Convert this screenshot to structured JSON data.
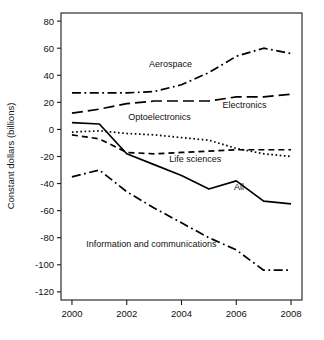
{
  "chart_data": {
    "type": "line",
    "title": "",
    "subtitle": "",
    "xlabel": "",
    "ylabel": "Constant dollars (billions)",
    "x": [
      2000,
      2001,
      2002,
      2003,
      2004,
      2005,
      2006,
      2007,
      2008
    ],
    "xlim": [
      1999.6,
      2008.4
    ],
    "ylim": [
      -126,
      86
    ],
    "x_ticks": [
      2000,
      2002,
      2004,
      2006,
      2008
    ],
    "x_tick_labels": [
      "2000",
      "2002",
      "2004",
      "2006",
      "2008"
    ],
    "y_ticks": [
      80,
      60,
      40,
      20,
      0,
      -20,
      -40,
      -60,
      -80,
      -100,
      -120
    ],
    "y_tick_labels": [
      "80",
      "60",
      "40",
      "20",
      "0",
      "-20",
      "-40",
      "-60",
      "-80",
      "-100",
      "-120"
    ],
    "grid": false,
    "legend": "inline-labels",
    "legend_position": "inline",
    "series": [
      {
        "name": "Aerospace",
        "values": [
          27,
          27,
          27,
          28,
          33,
          42,
          54,
          60,
          56
        ],
        "dash": "dashdot",
        "label_x": 2003.6,
        "label_y": 46,
        "label_anchor": "middle"
      },
      {
        "name": "Electronics",
        "values": [
          12,
          15,
          19,
          21,
          21,
          21,
          24,
          24,
          26
        ],
        "dash": "longdash",
        "label_x": 2006.3,
        "label_y": 16,
        "label_anchor": "middle"
      },
      {
        "name": "Optoelectronics",
        "values": [
          -2,
          -1,
          -3,
          -4,
          -6,
          -8,
          -14,
          -18,
          -20
        ],
        "dash": "dotted",
        "label_x": 2003.2,
        "label_y": 7,
        "label_anchor": "middle"
      },
      {
        "name": "Life sciences",
        "values": [
          -4,
          -7,
          -17,
          -18,
          -17,
          -16,
          -15,
          -15,
          -15
        ],
        "dash": "dashed",
        "label_x": 2004.5,
        "label_y": -24,
        "label_anchor": "middle"
      },
      {
        "name": "All",
        "values": [
          5,
          4,
          -18,
          -26,
          -34,
          -44,
          -38,
          -53,
          -55
        ],
        "dash": "solid",
        "label_x": 2006.1,
        "label_y": -45,
        "label_anchor": "middle"
      },
      {
        "name": "Information and communications",
        "values": [
          -35,
          -30,
          -46,
          -58,
          -69,
          -80,
          -89,
          -104,
          -104
        ],
        "dash": "dashdot",
        "label_x": 2002.9,
        "label_y": -87,
        "label_anchor": "middle"
      }
    ]
  }
}
